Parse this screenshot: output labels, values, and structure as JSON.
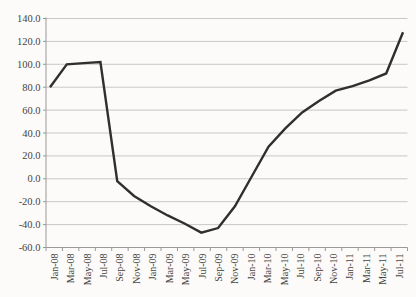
{
  "chart_data": {
    "type": "line",
    "title": "",
    "xlabel": "",
    "ylabel": "",
    "categories": [
      "Jan-08",
      "Mar-08",
      "May-08",
      "Jul-08",
      "Sep-08",
      "Nov-08",
      "Jan-09",
      "Mar-09",
      "May-09",
      "Jul-09",
      "Sep-09",
      "Nov-09",
      "Jan-10",
      "Mar-10",
      "May-10",
      "Jul-10",
      "Sep-10",
      "Nov-10",
      "Jan-11",
      "Mar-11",
      "May-11",
      "Jul-11"
    ],
    "values": [
      80,
      100,
      101,
      102,
      -2,
      -15,
      -24,
      -32,
      -39,
      -47,
      -43,
      -24,
      2,
      28,
      44,
      58,
      68,
      77,
      81,
      86,
      92,
      128
    ],
    "ylim": [
      -60,
      140
    ],
    "ytick_step": 20,
    "ytick_labels": [
      "140.0",
      "120.0",
      "100.0",
      "80.0",
      "60.0",
      "40.0",
      "20.0",
      "0.0",
      "-20.0",
      "-40.0",
      "-60.0"
    ],
    "grid": true,
    "legend": false,
    "series_name": ""
  },
  "colors": {
    "background": "#fcfbf9",
    "line": "#302f2d",
    "grid": "#c3c2bf",
    "axis": "#9a9996",
    "tick": "#9a9996",
    "label_text": "#444340"
  }
}
